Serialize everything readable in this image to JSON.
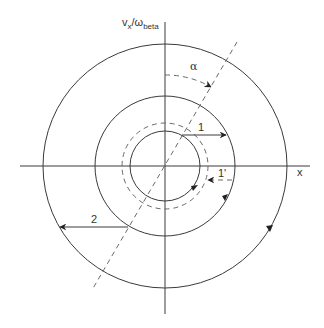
{
  "diagram": {
    "axis_labels": {
      "vertical_main": "v",
      "vertical_sub1": "x",
      "vertical_sep": "/ω",
      "vertical_sub2": "beta",
      "horizontal": "x"
    },
    "angle_label": "α",
    "arrow_labels": {
      "one": "1",
      "one_prime": "1'",
      "two": "2"
    },
    "circles": [
      {
        "name": "inner",
        "style": "solid"
      },
      {
        "name": "dashed",
        "style": "dashed"
      },
      {
        "name": "middle",
        "style": "solid"
      },
      {
        "name": "outer",
        "style": "solid"
      }
    ],
    "colors": {
      "stroke": "#3a3a3a",
      "dashed": "#6a6a6a",
      "background": "#ffffff"
    }
  }
}
